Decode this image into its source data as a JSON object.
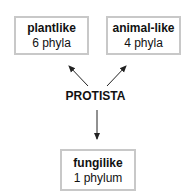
{
  "diagram": {
    "center": {
      "label": "PROTISTA"
    },
    "nodes": [
      {
        "id": "plantlike",
        "title": "plantlike",
        "subtitle": "6 phyla"
      },
      {
        "id": "animal-like",
        "title": "animal-like",
        "subtitle": "4 phyla"
      },
      {
        "id": "fungilike",
        "title": "fungilike",
        "subtitle": "1 phylum"
      }
    ],
    "edges": [
      {
        "from": "PROTISTA",
        "to": "plantlike"
      },
      {
        "from": "PROTISTA",
        "to": "animal-like"
      },
      {
        "from": "PROTISTA",
        "to": "fungilike"
      }
    ],
    "colors": {
      "box_border": "#c8c8c8",
      "arrow": "#222222",
      "text": "#111111"
    }
  }
}
